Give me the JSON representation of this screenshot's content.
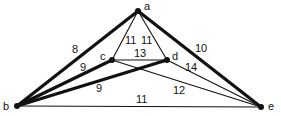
{
  "diagram": {
    "type": "weighted-graph",
    "colors": {
      "line": "#111111",
      "background": "#ffffff"
    },
    "vertices": [
      {
        "id": "a",
        "label": "a",
        "x": 138,
        "y": 11,
        "lx": 144,
        "ly": 10
      },
      {
        "id": "b",
        "label": "b",
        "x": 17,
        "y": 106,
        "lx": 3,
        "ly": 110
      },
      {
        "id": "c",
        "label": "c",
        "x": 112,
        "y": 60,
        "lx": 100,
        "ly": 60
      },
      {
        "id": "d",
        "label": "d",
        "x": 167,
        "y": 60,
        "lx": 172,
        "ly": 60
      },
      {
        "id": "e",
        "label": "e",
        "x": 261,
        "y": 107,
        "lx": 268,
        "ly": 110
      }
    ],
    "edges": [
      {
        "from": "a",
        "to": "b",
        "weight": "8",
        "thick": true,
        "lx": 72,
        "ly": 53
      },
      {
        "from": "a",
        "to": "e",
        "weight": "10",
        "thick": true,
        "lx": 195,
        "ly": 52
      },
      {
        "from": "a",
        "to": "c",
        "weight": "11",
        "thick": false,
        "lx": 125,
        "ly": 44
      },
      {
        "from": "a",
        "to": "d",
        "weight": "11",
        "thick": false,
        "lx": 141,
        "ly": 44
      },
      {
        "from": "c",
        "to": "d",
        "weight": "13",
        "thick": false,
        "lx": 134,
        "ly": 57
      },
      {
        "from": "b",
        "to": "c",
        "weight": "9",
        "thick": true,
        "lx": 80,
        "ly": 71
      },
      {
        "from": "b",
        "to": "d",
        "weight": "9",
        "thick": true,
        "lx": 96,
        "ly": 92
      },
      {
        "from": "c",
        "to": "e",
        "weight": "12",
        "thick": false,
        "lx": 173,
        "ly": 94
      },
      {
        "from": "d",
        "to": "e",
        "weight": "14",
        "thick": false,
        "lx": 185,
        "ly": 71
      },
      {
        "from": "b",
        "to": "e",
        "weight": "11",
        "thick": false,
        "lx": 136,
        "ly": 103
      }
    ]
  }
}
